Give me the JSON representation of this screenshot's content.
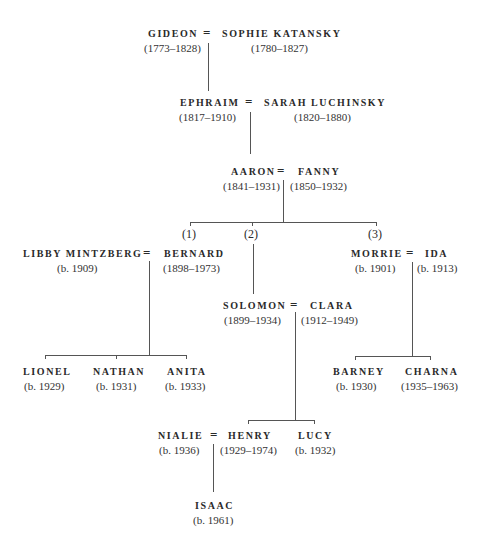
{
  "generations": {
    "g1": {
      "left": {
        "name": "GIDEON",
        "dates": "(1773–1828)"
      },
      "right": {
        "name": "SOPHIE KATANSKY",
        "dates": "(1780–1827)"
      }
    },
    "g2": {
      "left": {
        "name": "EPHRAIM",
        "dates": "(1817–1910)"
      },
      "right": {
        "name": "SARAH LUCHINSKY",
        "dates": "(1820–1880)"
      }
    },
    "g3": {
      "left": {
        "name": "AARON",
        "dates": "(1841–1931)"
      },
      "right": {
        "name": "FANNY",
        "dates": "(1850–1932)"
      }
    },
    "g4": {
      "branch_labels": [
        "(1)",
        "(2)",
        "(3)"
      ],
      "b1": {
        "left": {
          "name": "LIBBY MINTZBERG",
          "dates": "(b. 1909)"
        },
        "right": {
          "name": "BERNARD",
          "dates": "(1898–1973)"
        }
      },
      "b2": {
        "left": {
          "name": "SOLOMON",
          "dates": "(1899–1934)"
        },
        "right": {
          "name": "CLARA",
          "dates": "(1912–1949)"
        }
      },
      "b3": {
        "left": {
          "name": "MORRIE",
          "dates": "(b. 1901)"
        },
        "right": {
          "name": "IDA",
          "dates": "(b. 1913)"
        }
      }
    },
    "g5": {
      "b1_children": [
        {
          "name": "LIONEL",
          "dates": "(b. 1929)"
        },
        {
          "name": "NATHAN",
          "dates": "(b. 1931)"
        },
        {
          "name": "ANITA",
          "dates": "(b. 1933)"
        }
      ],
      "b3_children": [
        {
          "name": "BARNEY",
          "dates": "(b. 1930)"
        },
        {
          "name": "CHARNA",
          "dates": "(1935–1963)"
        }
      ],
      "b2_spouse": {
        "name": "NIALIE",
        "dates": "(b. 1936)"
      },
      "b2_children": [
        {
          "name": "HENRY",
          "dates": "(1929–1974)"
        },
        {
          "name": "LUCY",
          "dates": "(b. 1932)"
        }
      ]
    },
    "g6": {
      "child": {
        "name": "ISAAC",
        "dates": "(b. 1961)"
      }
    }
  },
  "marriage_symbol": "="
}
